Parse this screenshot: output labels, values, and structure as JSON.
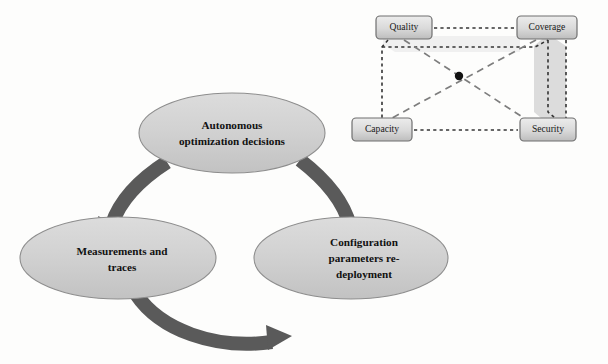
{
  "figure": {
    "background_color": "#fdfdfc",
    "cycle": {
      "name": "self-optimization-cycle",
      "arc_color": "#5a5a5a",
      "ellipse_fill": "#d2d2d2",
      "ellipse_stroke": "#8a8a8a",
      "nodes": [
        {
          "id": "autonomous-optimization-decisions",
          "lines": [
            "Autonomous",
            "optimization decisions"
          ],
          "cx": 232,
          "cy": 133,
          "rx": 93,
          "ry": 40
        },
        {
          "id": "measurements-and-traces",
          "lines": [
            "Measurements and",
            "traces"
          ],
          "cx": 118,
          "cy": 258,
          "rx": 98,
          "ry": 41
        },
        {
          "id": "configuration-parameters-redeployment",
          "lines": [
            "Configuration",
            "parameters re-",
            "deployment"
          ],
          "cx": 351,
          "cy": 258,
          "rx": 97,
          "ry": 41
        }
      ],
      "arrows": [
        {
          "id": "arrow-decisions-to-measurements",
          "from": "autonomous-optimization-decisions",
          "to": "measurements-and-traces"
        },
        {
          "id": "arrow-measurements-to-configuration",
          "from": "measurements-and-traces",
          "to": "configuration-parameters-redeployment"
        },
        {
          "id": "arrow-configuration-to-decisions",
          "from": "configuration-parameters-redeployment",
          "to": "autonomous-optimization-decisions"
        }
      ]
    },
    "network": {
      "name": "kpi-tradeoff-network",
      "box_fill_top": "#e3e3e3",
      "box_fill_bottom": "#bcbcbc",
      "box_stroke": "#6f6f6f",
      "dash_color": "#3a3a3a",
      "diagonal_color": "#7b7b7b",
      "shade_fill": "#d8d8d8",
      "center_dot_color": "#121212",
      "center_dot": {
        "cx": 459,
        "cy": 76,
        "r": 4
      },
      "nodes": [
        {
          "id": "quality",
          "label": "Quality",
          "x": 376,
          "y": 16,
          "w": 56,
          "h": 23
        },
        {
          "id": "coverage",
          "label": "Coverage",
          "x": 517,
          "y": 16,
          "w": 60,
          "h": 23
        },
        {
          "id": "capacity",
          "label": "Capacity",
          "x": 352,
          "y": 118,
          "w": 60,
          "h": 23
        },
        {
          "id": "security",
          "label": "Security",
          "x": 520,
          "y": 118,
          "w": 56,
          "h": 23
        }
      ],
      "edges": [
        {
          "id": "edge-quality-coverage",
          "from": "quality",
          "to": "coverage",
          "style": "dotted"
        },
        {
          "id": "edge-capacity-security",
          "from": "capacity",
          "to": "security",
          "style": "dotted"
        },
        {
          "id": "edge-quality-capacity",
          "from": "quality",
          "to": "capacity",
          "style": "dotted"
        },
        {
          "id": "edge-coverage-security",
          "from": "coverage",
          "to": "security",
          "style": "dotted"
        },
        {
          "id": "edge-quality-security",
          "from": "quality",
          "to": "security",
          "style": "dashed"
        },
        {
          "id": "edge-coverage-capacity",
          "from": "coverage",
          "to": "capacity",
          "style": "dashed"
        }
      ]
    }
  }
}
